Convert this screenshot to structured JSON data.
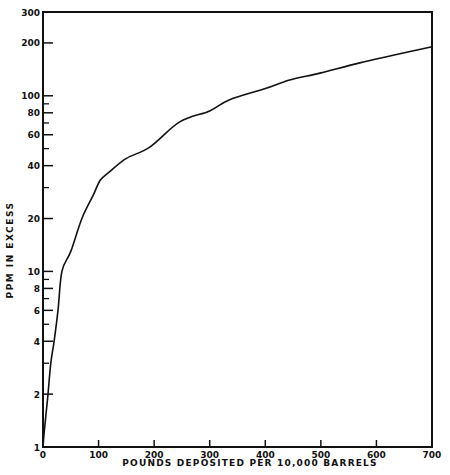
{
  "chart_data": {
    "type": "line",
    "title": "",
    "xlabel": "POUNDS DEPOSITED PER 10,000 BARRELS",
    "ylabel": "PPM IN EXCESS",
    "xlim": [
      0,
      700
    ],
    "ylim": [
      1,
      300
    ],
    "yscale": "log",
    "grid": false,
    "legend": null,
    "x_ticks": [
      0,
      100,
      200,
      300,
      400,
      500,
      600,
      700
    ],
    "x_tick_labels": [
      "0",
      "100",
      "200",
      "300",
      "400",
      "500",
      "600",
      "700"
    ],
    "y_ticks_labeled": [
      1,
      2,
      4,
      6,
      8,
      10,
      20,
      40,
      60,
      80,
      100,
      200,
      300
    ],
    "y_tick_labels": [
      "1",
      "2",
      "4",
      "6",
      "8",
      "10",
      "20",
      "40",
      "60",
      "80",
      "100",
      "200",
      "300"
    ],
    "y_ticks_minor": [
      3,
      5,
      7,
      9,
      30,
      50,
      70,
      90
    ],
    "series": [
      {
        "name": "PPM in excess",
        "x": [
          0,
          2,
          5,
          9,
          14,
          20,
          27,
          34,
          50,
          70,
          90,
          103,
          120,
          150,
          192,
          246,
          300,
          336,
          400,
          444,
          500,
          570,
          630,
          700
        ],
        "y": [
          1,
          1.2,
          1.5,
          2,
          3,
          4,
          6,
          10,
          13,
          20,
          27,
          33,
          37,
          44,
          51,
          71,
          82,
          95,
          110,
          123,
          135,
          154,
          170,
          190
        ]
      }
    ]
  }
}
